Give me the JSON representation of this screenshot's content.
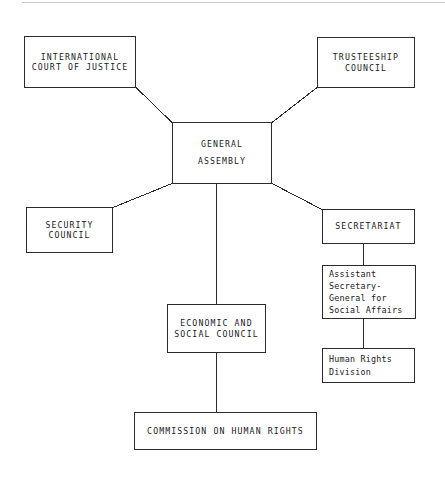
{
  "diagram": {
    "line_color": "#2b2b2b",
    "background_color": "#ffffff",
    "text_color": "#1a1a1a",
    "nodes": [
      {
        "id": "international-court-of-justice",
        "label": "INTERNATIONAL\nCOURT OF JUSTICE",
        "style": "caps"
      },
      {
        "id": "trusteeship-council",
        "label": "TRUSTEESHIP\nCOUNCIL",
        "style": "caps"
      },
      {
        "id": "general-assembly",
        "label": "GENERAL\nASSEMBLY",
        "style": "caps"
      },
      {
        "id": "security-council",
        "label": "SECURITY\nCOUNCIL",
        "style": "caps"
      },
      {
        "id": "secretariat",
        "label": "SECRETARIAT",
        "style": "caps"
      },
      {
        "id": "assistant-secretary-general-for-social-affairs",
        "label": "Assistant\nSecretary-\nGeneral for\nSocial Affairs",
        "style": "mixed"
      },
      {
        "id": "human-rights-division",
        "label": "Human Rights\nDivision",
        "style": "mixed"
      },
      {
        "id": "economic-and-social-council",
        "label": "ECONOMIC AND\nSOCIAL COUNCIL",
        "style": "caps"
      },
      {
        "id": "commission-on-human-rights",
        "label": "COMMISSION ON HUMAN RIGHTS",
        "style": "caps"
      }
    ],
    "edges": [
      {
        "id": "edge-icj-to-general-assembly",
        "from": "international-court-of-justice",
        "to": "general-assembly",
        "kind": "diagonal"
      },
      {
        "id": "edge-trusteeship-to-general-assembly",
        "from": "trusteeship-council",
        "to": "general-assembly",
        "kind": "diagonal"
      },
      {
        "id": "edge-general-assembly-to-security",
        "from": "general-assembly",
        "to": "security-council",
        "kind": "diagonal"
      },
      {
        "id": "edge-general-assembly-to-secretariat",
        "from": "general-assembly",
        "to": "secretariat",
        "kind": "diagonal"
      },
      {
        "id": "edge-general-assembly-to-ecosoc",
        "from": "general-assembly",
        "to": "economic-and-social-council",
        "kind": "vertical"
      },
      {
        "id": "edge-secretariat-to-asg",
        "from": "secretariat",
        "to": "assistant-secretary-general-for-social-affairs",
        "kind": "vertical"
      },
      {
        "id": "edge-asg-to-human-rights-division",
        "from": "assistant-secretary-general-for-social-affairs",
        "to": "human-rights-division",
        "kind": "vertical"
      },
      {
        "id": "edge-ecosoc-to-commission",
        "from": "economic-and-social-council",
        "to": "commission-on-human-rights",
        "kind": "vertical"
      }
    ]
  }
}
